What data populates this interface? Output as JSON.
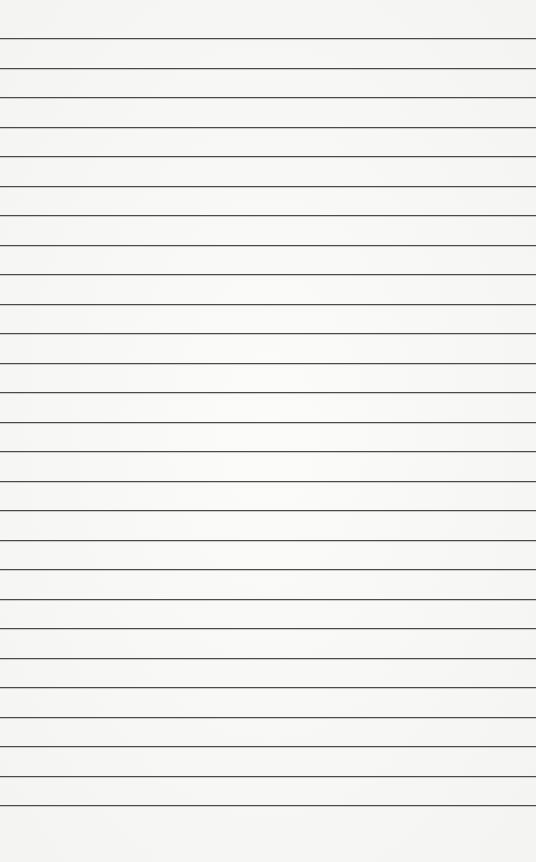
{
  "paper": {
    "type": "lined-paper",
    "line_color": "#4a4a4a",
    "background_color": "#f7f7f6",
    "first_line_y": 38,
    "line_spacing": 29.5,
    "line_count": 27
  }
}
